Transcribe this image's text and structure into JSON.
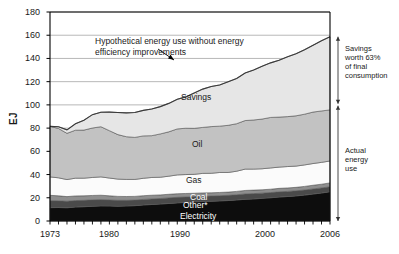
{
  "chart_data": {
    "type": "area",
    "title": "",
    "xlabel": "",
    "ylabel": "EJ",
    "xlim": [
      1973,
      2006
    ],
    "ylim": [
      0,
      180
    ],
    "grid": true,
    "legend_position": "inline-labels",
    "ytick_labels": [
      "180",
      "160",
      "140",
      "120",
      "100",
      "80",
      "60",
      "40",
      "20",
      "0"
    ],
    "ytick_values": [
      180,
      160,
      140,
      120,
      100,
      80,
      60,
      40,
      20,
      0
    ],
    "xtick_labels": [
      "1973",
      "1980",
      "1990",
      "2000",
      "2006"
    ],
    "xtick_values": [
      1973,
      1980,
      1990,
      2000,
      2006
    ],
    "minor_xticks": "every year 1973-2006",
    "x": [
      1973,
      1974,
      1975,
      1976,
      1977,
      1978,
      1979,
      1980,
      1981,
      1982,
      1983,
      1984,
      1985,
      1986,
      1987,
      1988,
      1989,
      1990,
      1991,
      1992,
      1993,
      1994,
      1995,
      1996,
      1997,
      1998,
      1999,
      2000,
      2001,
      2002,
      2003,
      2004,
      2005,
      2006
    ],
    "stacking": "bottom-to-top: Electricity, Other*, Coal, Gas, Oil, Savings",
    "series": [
      {
        "name": "Electricity",
        "color": "#0d0d0d",
        "label_color": "#ffffff",
        "values": [
          11.5,
          11.6,
          11.4,
          12.0,
          12.3,
          12.7,
          13.0,
          12.9,
          12.8,
          12.9,
          13.2,
          13.8,
          14.2,
          14.6,
          15.1,
          15.6,
          16.0,
          16.4,
          16.8,
          17.0,
          17.3,
          17.6,
          18.1,
          18.7,
          19.0,
          19.5,
          20.0,
          20.6,
          21.1,
          21.6,
          22.3,
          23.2,
          24.1,
          25.2
        ]
      },
      {
        "name": "Other*",
        "color": "#4a4a4a",
        "label_color": "#ffffff",
        "values": [
          6.0,
          5.8,
          5.6,
          5.6,
          5.5,
          5.5,
          5.4,
          5.2,
          5.0,
          4.9,
          4.8,
          4.8,
          4.8,
          4.8,
          4.8,
          4.8,
          4.7,
          4.6,
          4.5,
          4.5,
          4.5,
          4.5,
          4.5,
          4.6,
          4.6,
          4.5,
          4.5,
          4.5,
          4.4,
          4.4,
          4.4,
          4.4,
          4.4,
          4.3
        ]
      },
      {
        "name": "Coal",
        "color": "#8e8e8e",
        "label_color": "#ffffff",
        "values": [
          4.6,
          4.3,
          4.0,
          4.0,
          3.9,
          3.8,
          3.8,
          3.6,
          3.4,
          3.3,
          3.2,
          3.2,
          3.2,
          3.1,
          3.1,
          3.1,
          3.0,
          2.9,
          2.9,
          2.8,
          2.8,
          2.8,
          2.9,
          3.0,
          3.0,
          2.9,
          2.9,
          3.0,
          3.0,
          3.0,
          3.1,
          3.2,
          3.2,
          3.3
        ]
      },
      {
        "name": "Gas",
        "color": "#fbfbfb",
        "label_color": "#1a1a1a",
        "values": [
          15.9,
          15.5,
          14.7,
          15.3,
          15.2,
          15.5,
          15.8,
          15.3,
          14.9,
          14.7,
          14.6,
          15.0,
          15.3,
          15.2,
          15.6,
          16.2,
          16.3,
          16.3,
          16.8,
          16.8,
          17.2,
          16.9,
          17.4,
          18.4,
          18.1,
          18.1,
          18.3,
          18.3,
          18.4,
          18.3,
          18.5,
          18.7,
          18.8,
          18.9
        ]
      },
      {
        "name": "Oil",
        "color": "#c2c2c2",
        "label_color": "#1a1a1a",
        "values": [
          43.5,
          42.5,
          39.8,
          41.3,
          41.4,
          42.6,
          43.2,
          40.8,
          38.3,
          36.8,
          36.2,
          36.5,
          36.0,
          37.3,
          38.2,
          39.6,
          39.9,
          39.6,
          39.6,
          40.2,
          39.9,
          40.6,
          40.9,
          41.8,
          42.3,
          42.8,
          43.5,
          43.1,
          43.0,
          43.3,
          43.7,
          44.3,
          44.3,
          44.0
        ]
      },
      {
        "name": "Savings",
        "color": "#e6e6e6",
        "label_color": "#1a1a1a",
        "values": [
          0.0,
          1.5,
          3.0,
          5.5,
          8.5,
          11.5,
          12.5,
          16.0,
          19.0,
          20.5,
          21.5,
          22.0,
          23.0,
          23.5,
          24.5,
          25.5,
          27.0,
          30.5,
          33.0,
          34.5,
          35.5,
          37.5,
          39.0,
          41.0,
          43.0,
          45.5,
          47.0,
          49.0,
          51.5,
          53.5,
          55.5,
          57.5,
          60.5,
          63.0
        ]
      }
    ],
    "hypothetical_line": {
      "name": "Hypothetical energy use without energy efficiency improvements",
      "values": [
        81.5,
        81.2,
        78.5,
        83.7,
        86.8,
        91.6,
        93.7,
        93.8,
        93.4,
        93.1,
        93.5,
        95.3,
        96.5,
        98.5,
        101.3,
        104.8,
        106.9,
        110.3,
        113.6,
        115.8,
        117.2,
        119.9,
        122.8,
        127.5,
        130.0,
        133.3,
        136.2,
        138.5,
        141.4,
        144.1,
        147.5,
        151.3,
        155.3,
        158.7
      ]
    },
    "annotations": {
      "hypothetical_label": "Hypothetical energy use without energy\nefficiency improvements",
      "hypothetical_line1": "Hypothetical energy use without energy",
      "hypothetical_line2": "efficiency improvements",
      "savings_bracket": "Savings\nworth 63%\nof final\nconsumption",
      "savings_bracket_line1": "Savings",
      "savings_bracket_line2": "worth 63%",
      "savings_bracket_line3": "of final",
      "savings_bracket_line4": "consumption",
      "actual_bracket": "Actual\nenergy\nuse",
      "actual_bracket_line1": "Actual",
      "actual_bracket_line2": "energy",
      "actual_bracket_line3": "use"
    }
  },
  "caption": {
    "text": ""
  },
  "colors": {
    "electricity": "#0d0d0d",
    "other": "#4a4a4a",
    "coal": "#8e8e8e",
    "gas": "#fbfbfb",
    "oil": "#c2c2c2",
    "savings": "#e6e6e6",
    "axis": "#000000",
    "grid": "#9a9a9a"
  }
}
